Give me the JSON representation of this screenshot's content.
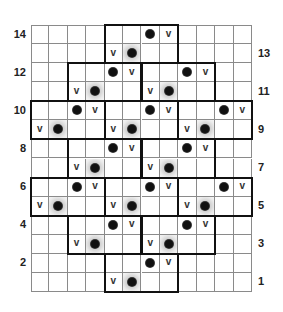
{
  "chart": {
    "columns": 12,
    "rows": 14,
    "colors": {
      "grid_line": "#8a8a8a",
      "block_border": "#111111",
      "dot": "#111111",
      "shade": "#c8c8c8",
      "label": "#222222"
    },
    "legend_symbols": {
      "dot": "filled-circle",
      "v": "v",
      "shaded_dot": "filled-circle-on-gray-halo"
    },
    "row_labels": [
      {
        "row": 14,
        "side": "left",
        "text": "14"
      },
      {
        "row": 13,
        "side": "right",
        "text": "13"
      },
      {
        "row": 12,
        "side": "left",
        "text": "12"
      },
      {
        "row": 11,
        "side": "right",
        "text": "11"
      },
      {
        "row": 10,
        "side": "left",
        "text": "10"
      },
      {
        "row": 9,
        "side": "right",
        "text": "9"
      },
      {
        "row": 8,
        "side": "left",
        "text": "8"
      },
      {
        "row": 7,
        "side": "right",
        "text": "7"
      },
      {
        "row": 6,
        "side": "left",
        "text": "6"
      },
      {
        "row": 5,
        "side": "right",
        "text": "5"
      },
      {
        "row": 4,
        "side": "left",
        "text": "4"
      },
      {
        "row": 3,
        "side": "right",
        "text": "3"
      },
      {
        "row": 2,
        "side": "left",
        "text": "2"
      },
      {
        "row": 1,
        "side": "right",
        "text": "1"
      }
    ],
    "cells": [
      {
        "row": 14,
        "col": 6,
        "type": "dot"
      },
      {
        "row": 14,
        "col": 7,
        "type": "v"
      },
      {
        "row": 13,
        "col": 4,
        "type": "v"
      },
      {
        "row": 13,
        "col": 5,
        "type": "shaded_dot"
      },
      {
        "row": 12,
        "col": 4,
        "type": "dot"
      },
      {
        "row": 12,
        "col": 5,
        "type": "v"
      },
      {
        "row": 12,
        "col": 8,
        "type": "dot"
      },
      {
        "row": 12,
        "col": 9,
        "type": "v"
      },
      {
        "row": 11,
        "col": 2,
        "type": "v"
      },
      {
        "row": 11,
        "col": 3,
        "type": "shaded_dot"
      },
      {
        "row": 11,
        "col": 6,
        "type": "v"
      },
      {
        "row": 11,
        "col": 7,
        "type": "shaded_dot"
      },
      {
        "row": 10,
        "col": 2,
        "type": "dot"
      },
      {
        "row": 10,
        "col": 3,
        "type": "v"
      },
      {
        "row": 10,
        "col": 6,
        "type": "dot"
      },
      {
        "row": 10,
        "col": 7,
        "type": "v"
      },
      {
        "row": 10,
        "col": 10,
        "type": "dot"
      },
      {
        "row": 10,
        "col": 11,
        "type": "v"
      },
      {
        "row": 9,
        "col": 0,
        "type": "v"
      },
      {
        "row": 9,
        "col": 1,
        "type": "shaded_dot"
      },
      {
        "row": 9,
        "col": 4,
        "type": "v"
      },
      {
        "row": 9,
        "col": 5,
        "type": "shaded_dot"
      },
      {
        "row": 9,
        "col": 8,
        "type": "v"
      },
      {
        "row": 9,
        "col": 9,
        "type": "shaded_dot"
      },
      {
        "row": 8,
        "col": 4,
        "type": "dot"
      },
      {
        "row": 8,
        "col": 5,
        "type": "v"
      },
      {
        "row": 8,
        "col": 8,
        "type": "dot"
      },
      {
        "row": 8,
        "col": 9,
        "type": "v"
      },
      {
        "row": 7,
        "col": 2,
        "type": "v"
      },
      {
        "row": 7,
        "col": 3,
        "type": "shaded_dot"
      },
      {
        "row": 7,
        "col": 6,
        "type": "v"
      },
      {
        "row": 7,
        "col": 7,
        "type": "shaded_dot"
      },
      {
        "row": 6,
        "col": 2,
        "type": "dot"
      },
      {
        "row": 6,
        "col": 3,
        "type": "v"
      },
      {
        "row": 6,
        "col": 6,
        "type": "dot"
      },
      {
        "row": 6,
        "col": 7,
        "type": "v"
      },
      {
        "row": 6,
        "col": 10,
        "type": "dot"
      },
      {
        "row": 6,
        "col": 11,
        "type": "v"
      },
      {
        "row": 5,
        "col": 0,
        "type": "v"
      },
      {
        "row": 5,
        "col": 1,
        "type": "shaded_dot"
      },
      {
        "row": 5,
        "col": 4,
        "type": "v"
      },
      {
        "row": 5,
        "col": 5,
        "type": "shaded_dot"
      },
      {
        "row": 5,
        "col": 8,
        "type": "v"
      },
      {
        "row": 5,
        "col": 9,
        "type": "shaded_dot"
      },
      {
        "row": 4,
        "col": 4,
        "type": "dot"
      },
      {
        "row": 4,
        "col": 5,
        "type": "v"
      },
      {
        "row": 4,
        "col": 8,
        "type": "dot"
      },
      {
        "row": 4,
        "col": 9,
        "type": "v"
      },
      {
        "row": 3,
        "col": 2,
        "type": "v"
      },
      {
        "row": 3,
        "col": 3,
        "type": "shaded_dot"
      },
      {
        "row": 3,
        "col": 6,
        "type": "v"
      },
      {
        "row": 3,
        "col": 7,
        "type": "shaded_dot"
      },
      {
        "row": 2,
        "col": 6,
        "type": "dot"
      },
      {
        "row": 2,
        "col": 7,
        "type": "v"
      },
      {
        "row": 1,
        "col": 4,
        "type": "v"
      },
      {
        "row": 1,
        "col": 5,
        "type": "shaded_dot"
      }
    ],
    "blocks": [
      {
        "top_row": 14,
        "col": 4,
        "width": 4,
        "height": 2
      },
      {
        "top_row": 12,
        "col": 2,
        "width": 4,
        "height": 2
      },
      {
        "top_row": 12,
        "col": 6,
        "width": 4,
        "height": 2
      },
      {
        "top_row": 10,
        "col": 0,
        "width": 4,
        "height": 2
      },
      {
        "top_row": 10,
        "col": 4,
        "width": 4,
        "height": 2
      },
      {
        "top_row": 10,
        "col": 8,
        "width": 4,
        "height": 2
      },
      {
        "top_row": 8,
        "col": 2,
        "width": 4,
        "height": 2
      },
      {
        "top_row": 8,
        "col": 6,
        "width": 4,
        "height": 2
      },
      {
        "top_row": 6,
        "col": 0,
        "width": 4,
        "height": 2
      },
      {
        "top_row": 6,
        "col": 4,
        "width": 4,
        "height": 2
      },
      {
        "top_row": 6,
        "col": 8,
        "width": 4,
        "height": 2
      },
      {
        "top_row": 4,
        "col": 2,
        "width": 4,
        "height": 2
      },
      {
        "top_row": 4,
        "col": 6,
        "width": 4,
        "height": 2
      },
      {
        "top_row": 2,
        "col": 4,
        "width": 4,
        "height": 2
      }
    ]
  }
}
